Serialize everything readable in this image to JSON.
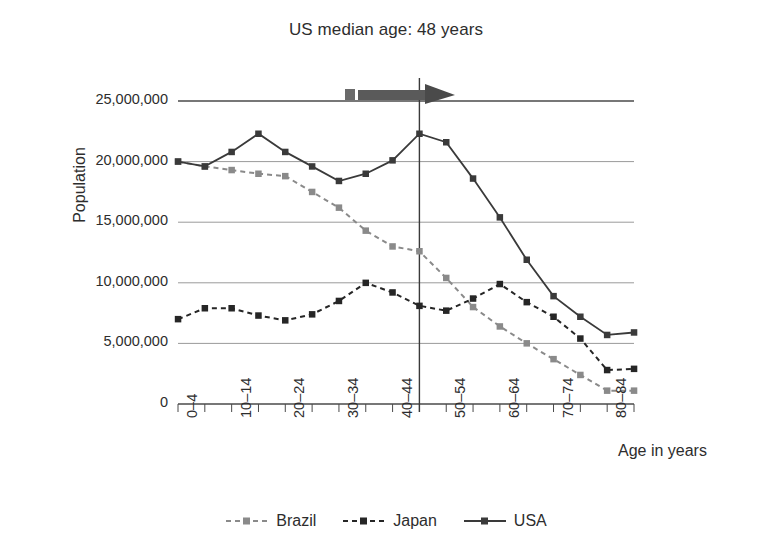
{
  "chart_data": {
    "type": "line",
    "title": "US median age: 48 years",
    "xlabel": "Age in years",
    "ylabel": "Population",
    "ylim": [
      0,
      25000000
    ],
    "yticks": [
      0,
      5000000,
      10000000,
      15000000,
      20000000,
      25000000
    ],
    "ytick_labels": [
      "0",
      "5,000,000",
      "10,000,000",
      "15,000,000",
      "20,000,000",
      "25,000,000"
    ],
    "grid": "horizontal",
    "legend_position": "bottom",
    "categories": [
      "0–4",
      "5–9",
      "10–14",
      "15–19",
      "20–24",
      "25–29",
      "30–34",
      "35–39",
      "40–44",
      "45–49",
      "50–54",
      "55–59",
      "60–64",
      "65–69",
      "70–74",
      "75–79",
      "80–84",
      "85+"
    ],
    "xtick_labels_shown": [
      "0–4",
      "10–14",
      "20–24",
      "30–34",
      "40–44",
      "50–54",
      "60–64",
      "70–74",
      "80–84"
    ],
    "series": [
      {
        "name": "Brazil",
        "color": "#8a8a8a",
        "style": "dotted",
        "marker": "square",
        "values": [
          20000000,
          19600000,
          19300000,
          19000000,
          18800000,
          17500000,
          16200000,
          14300000,
          13000000,
          12600000,
          10400000,
          8000000,
          6400000,
          5000000,
          3700000,
          2400000,
          1100000,
          1100000
        ]
      },
      {
        "name": "Japan",
        "color": "#262626",
        "style": "dotted",
        "marker": "square",
        "values": [
          7000000,
          7900000,
          7900000,
          7300000,
          6900000,
          7400000,
          8500000,
          10000000,
          9200000,
          8100000,
          7700000,
          8700000,
          9900000,
          8400000,
          7200000,
          5400000,
          2800000,
          2900000
        ]
      },
      {
        "name": "USA",
        "color": "#3a3a3a",
        "style": "solid",
        "marker": "square",
        "values": [
          20000000,
          19600000,
          20800000,
          22300000,
          20800000,
          19600000,
          18400000,
          19000000,
          20100000,
          22300000,
          21600000,
          18600000,
          15400000,
          11900000,
          8900000,
          7200000,
          5700000,
          5900000
        ]
      }
    ],
    "annotations": [
      {
        "name": "median-age-line",
        "type": "vertical-line",
        "at_category": "45–49",
        "color": "#3a3a3a"
      },
      {
        "name": "median-age-arrow",
        "type": "arrow-right",
        "color": "#4a4a4a"
      }
    ]
  },
  "legend": {
    "items": [
      {
        "label": "Brazil"
      },
      {
        "label": "Japan"
      },
      {
        "label": "USA"
      }
    ]
  }
}
